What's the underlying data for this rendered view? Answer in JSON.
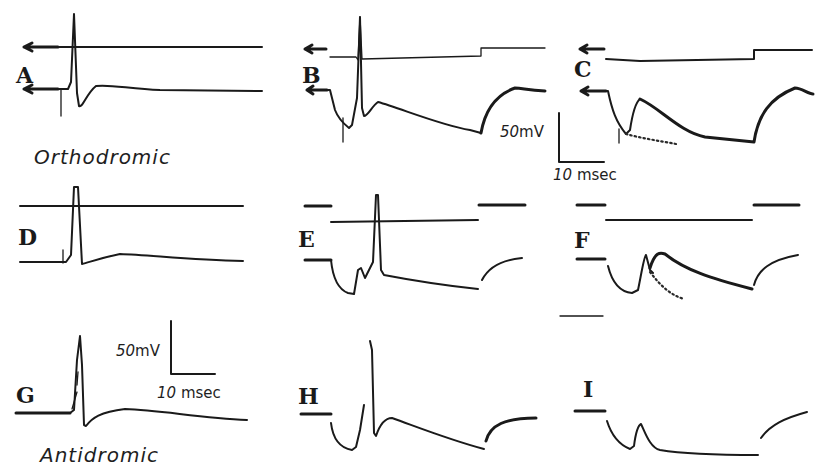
{
  "figure": {
    "panels": [
      {
        "id": "A",
        "label": "A",
        "condition": "orthodromic"
      },
      {
        "id": "B",
        "label": "B",
        "condition": "orthodromic"
      },
      {
        "id": "C",
        "label": "C",
        "condition": "orthodromic"
      },
      {
        "id": "D",
        "label": "D",
        "condition": "orthodromic"
      },
      {
        "id": "E",
        "label": "E",
        "condition": "orthodromic"
      },
      {
        "id": "F",
        "label": "F",
        "condition": "orthodromic"
      },
      {
        "id": "G",
        "label": "G",
        "condition": "antidromic"
      },
      {
        "id": "H",
        "label": "H",
        "condition": "antidromic"
      },
      {
        "id": "I",
        "label": "I",
        "condition": "antidromic"
      }
    ],
    "condition_labels": {
      "orthodromic": "Orthodromic",
      "antidromic": "Antidromic"
    },
    "scale_bars": [
      {
        "position": "upper-right",
        "voltage_value": "50",
        "voltage_unit": "mV",
        "time_value": "10",
        "time_unit": "msec"
      },
      {
        "position": "lower-left",
        "voltage_value": "50",
        "voltage_unit": "mV",
        "time_value": "10",
        "time_unit": "msec"
      }
    ],
    "trace_color": "#1a1a1a",
    "background": "#ffffff"
  }
}
